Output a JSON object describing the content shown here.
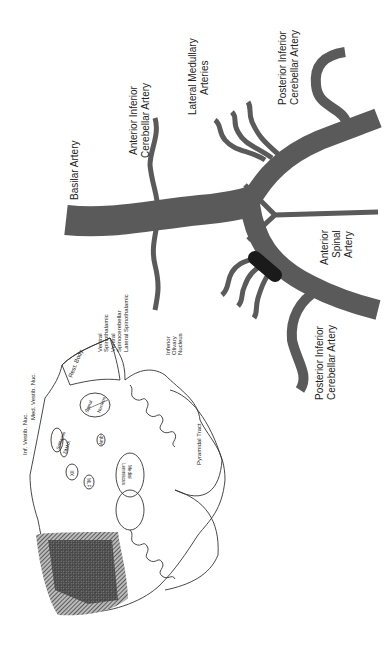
{
  "figure": {
    "orientation": "rotated-90-ccw",
    "colors": {
      "background": "#ffffff",
      "artery": "#5a5a5a",
      "occlusion": "#1a1a1a",
      "outline": "#333333",
      "infarct_hatch": "#444444"
    }
  },
  "arteries": {
    "basilar": "Basilar Artery",
    "aica": [
      "Anterior Inferior",
      "Cerebellar Artery"
    ],
    "lateral_medullary": [
      "Lateral Medullary",
      "Arteries"
    ],
    "pica_upper": [
      "Posterior Inferior",
      "Cerebellar Artery"
    ],
    "anterior_spinal": [
      "Anterior",
      "Spinal",
      "Artery"
    ],
    "pica_lower": [
      "Posterior Inferior",
      "Cerebellar Artery"
    ]
  },
  "medulla": {
    "labels": {
      "inf_vestib": "Inf. Vestib. Nuc.",
      "med_vestib": "Med. Vestib. Nuc.",
      "rest_body": "Rest. Body",
      "ventral_spinothalamic": [
        "Ventral",
        "Spinothalamic"
      ],
      "ventral_spinocerebellar": [
        "Ventral",
        "Spinocerebellar"
      ],
      "lateral_spinothalamic": "Lateral Spinothalamic",
      "inferior_olivary": [
        "Inferior",
        "Olivary",
        "Nucleus"
      ],
      "spinal_tract": [
        "Spinal",
        "Tract"
      ],
      "spinal_nucleus": [
        "Spinal",
        "Nucleus"
      ],
      "solitarius": "Solitarius",
      "dmnx": "DMNX",
      "amb": "Amb",
      "xii": "XII",
      "mlf": "MLF",
      "medial_lemniscus": [
        "Medial",
        "Lemniscus"
      ],
      "pyramidal_tract": "Pyramidal Tract"
    }
  }
}
